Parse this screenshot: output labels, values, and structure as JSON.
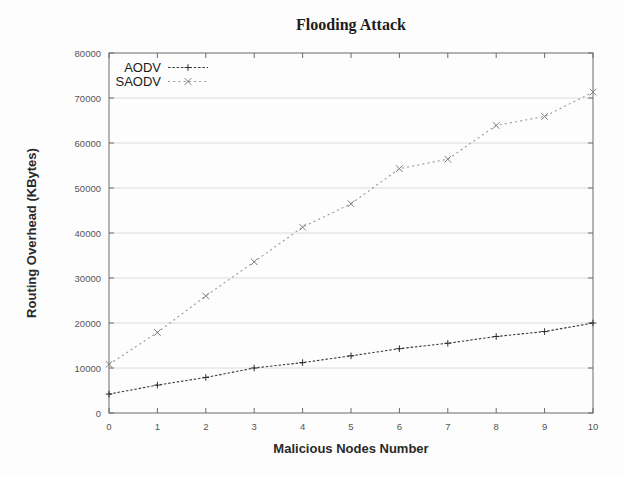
{
  "chart_data": {
    "type": "line",
    "title": "Flooding Attack",
    "xlabel": "Malicious Nodes Number",
    "ylabel": "Routing Overhead (KBytes)",
    "x": [
      0,
      1,
      2,
      3,
      4,
      5,
      6,
      7,
      8,
      9,
      10
    ],
    "series": [
      {
        "name": "AODV",
        "values": [
          4200,
          6200,
          7900,
          10000,
          11200,
          12700,
          14300,
          15500,
          17000,
          18100,
          20000
        ],
        "color": "#3a3a3a",
        "marker": "plus",
        "marker_color": "#2f2f2f",
        "dash": "2.5 1.8"
      },
      {
        "name": "SAODV",
        "values": [
          10800,
          17900,
          26000,
          33600,
          41300,
          46500,
          54300,
          56400,
          63900,
          65900,
          71300
        ],
        "color": "#979797",
        "marker": "cross",
        "marker_color": "#7d7d7d",
        "dash": "2 3.2"
      }
    ],
    "xlim": [
      0,
      10
    ],
    "ylim": [
      0,
      80000
    ],
    "x_ticks": [
      0,
      1,
      2,
      3,
      4,
      5,
      6,
      7,
      8,
      9,
      10
    ],
    "y_ticks": [
      0,
      10000,
      20000,
      30000,
      40000,
      50000,
      60000,
      70000,
      80000
    ],
    "grid": "horizontal",
    "legend_position": "top-left"
  },
  "style": {
    "border_color": "#6a6a6a",
    "grid_color": "#dcdcdc",
    "tick_label_color": "#555555",
    "legend_text_color": "#1a1a1a"
  }
}
